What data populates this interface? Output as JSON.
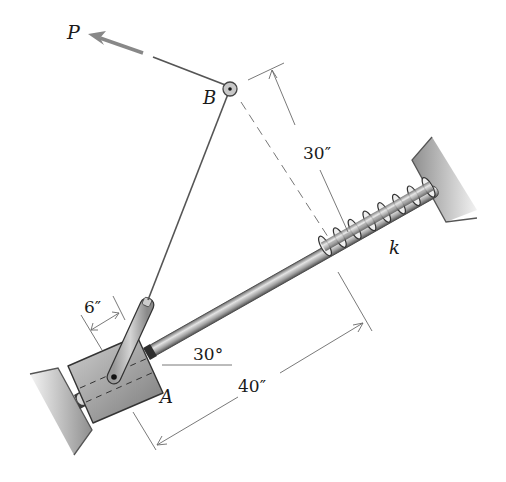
{
  "diagram": {
    "type": "mechanics-figure"
  },
  "labels": {
    "force": "P",
    "pulley": "B",
    "collar": "A",
    "spring": "k",
    "dim_30": "30″",
    "dim_40": "40″",
    "dim_6": "6″",
    "angle": "30°"
  },
  "colors": {
    "line": "#555555",
    "dim_line": "#6a6a6a",
    "force_arrow": "#777777",
    "metal_dark": "#6e6e6e",
    "metal_light": "#d8d8d8",
    "wall": "#bdbdbd"
  }
}
